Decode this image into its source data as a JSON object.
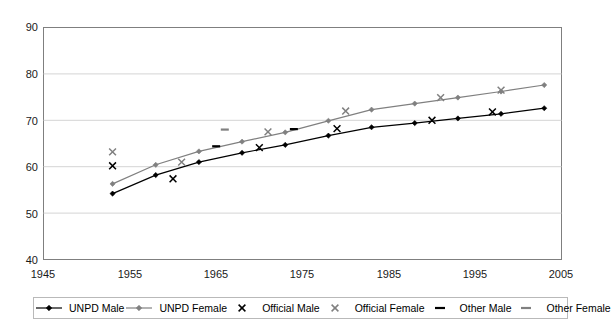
{
  "chart_data": {
    "type": "line",
    "title": "",
    "xlabel": "",
    "ylabel": "",
    "xlim": [
      1945,
      2005
    ],
    "ylim": [
      40,
      90
    ],
    "x_ticks": [
      1945,
      1955,
      1965,
      1975,
      1985,
      1995,
      2005
    ],
    "y_ticks": [
      40,
      50,
      60,
      70,
      80,
      90
    ],
    "grid": "horizontal",
    "legend_position": "bottom",
    "series": [
      {
        "name": "UNPD Male",
        "type": "line",
        "marker": "diamond",
        "color": "#000000",
        "points": [
          [
            1953,
            54.2
          ],
          [
            1958,
            58.2
          ],
          [
            1963,
            61.0
          ],
          [
            1968,
            63.0
          ],
          [
            1973,
            64.7
          ],
          [
            1978,
            66.7
          ],
          [
            1983,
            68.5
          ],
          [
            1988,
            69.4
          ],
          [
            1993,
            70.4
          ],
          [
            1998,
            71.4
          ],
          [
            2003,
            72.6
          ]
        ]
      },
      {
        "name": "UNPD Female",
        "type": "line",
        "marker": "diamond",
        "color": "#808080",
        "points": [
          [
            1953,
            56.3
          ],
          [
            1958,
            60.4
          ],
          [
            1963,
            63.3
          ],
          [
            1968,
            65.4
          ],
          [
            1973,
            67.4
          ],
          [
            1978,
            69.9
          ],
          [
            1983,
            72.3
          ],
          [
            1988,
            73.6
          ],
          [
            1993,
            74.9
          ],
          [
            1998,
            76.2
          ],
          [
            2003,
            77.6
          ]
        ]
      },
      {
        "name": "Official Male",
        "type": "scatter",
        "marker": "x",
        "color": "#000000",
        "points": [
          [
            1953,
            60.2
          ],
          [
            1960,
            57.4
          ],
          [
            1970,
            64.1
          ],
          [
            1979,
            68.2
          ],
          [
            1990,
            70.0
          ],
          [
            1997,
            71.8
          ]
        ]
      },
      {
        "name": "Official Female",
        "type": "scatter",
        "marker": "x",
        "color": "#808080",
        "points": [
          [
            1953,
            63.2
          ],
          [
            1961,
            61.0
          ],
          [
            1971,
            67.5
          ],
          [
            1980,
            72.0
          ],
          [
            1991,
            74.9
          ],
          [
            1998,
            76.5
          ]
        ]
      },
      {
        "name": "Other Male",
        "type": "scatter",
        "marker": "dash",
        "color": "#000000",
        "points": [
          [
            1965,
            64.4
          ],
          [
            1974,
            68.1
          ]
        ]
      },
      {
        "name": "Other Female",
        "type": "scatter",
        "marker": "dash",
        "color": "#808080",
        "points": [
          [
            1966,
            68.0
          ]
        ]
      }
    ]
  },
  "axes": {
    "y_tick_labels": [
      "90",
      "80",
      "70",
      "60",
      "50",
      "40"
    ],
    "x_tick_labels": [
      "1945",
      "1955",
      "1965",
      "1975",
      "1985",
      "1995",
      "2005"
    ]
  },
  "legend": {
    "items": [
      {
        "label": "UNPD Male",
        "key": "line-diamond",
        "color": "#000000"
      },
      {
        "label": "UNPD Female",
        "key": "line-diamond",
        "color": "#808080"
      },
      {
        "label": "Official Male",
        "key": "x-marker",
        "color": "#000000"
      },
      {
        "label": "Official Female",
        "key": "x-marker",
        "color": "#808080"
      },
      {
        "label": "Other Male",
        "key": "dash-marker",
        "color": "#000000"
      },
      {
        "label": "Other Female",
        "key": "dash-marker",
        "color": "#808080"
      }
    ]
  },
  "colors": {
    "male": "#000000",
    "female": "#808080",
    "grid": "#d0d0d0",
    "frame": "#808080"
  }
}
